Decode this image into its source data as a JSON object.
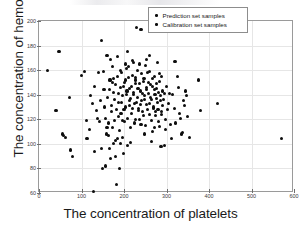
{
  "axes": {
    "xlabel": "The concentration of platelets",
    "ylabel": "The concentration of hemoglobin",
    "xticks": [
      "0",
      "100",
      "200",
      "300",
      "400",
      "500",
      "600"
    ],
    "yticks": [
      "60",
      "80",
      "100",
      "120",
      "140",
      "160",
      "180",
      "200"
    ]
  },
  "legend": {
    "items": [
      {
        "label": "Prediction set samples",
        "marker": "dot",
        "color": "#0d0d0d"
      },
      {
        "label": "Calibration set samples",
        "marker": "dot",
        "color": "#0d0d0d"
      }
    ]
  },
  "colors": {
    "marker": "#0d0d0d",
    "grid": "#e6e6e6",
    "frame": "#9a9a9a",
    "background": "#ffffff",
    "text": "#1a1a1a"
  },
  "chart_data": {
    "type": "scatter",
    "title": "",
    "xlabel": "The concentration of platelets",
    "ylabel": "The concentration of hemoglobin",
    "xlim": [
      0,
      600
    ],
    "ylim": [
      60,
      200
    ],
    "xticks": [
      0,
      100,
      200,
      300,
      400,
      500,
      600
    ],
    "yticks": [
      60,
      80,
      100,
      120,
      140,
      160,
      180,
      200
    ],
    "grid": true,
    "legend_position": "upper right",
    "series": [
      {
        "name": "Prediction set samples",
        "marker": "dot",
        "color": "#0d0d0d",
        "points": [
          [
            20,
            160
          ],
          [
            40,
            127
          ],
          [
            47,
            175
          ],
          [
            55,
            108
          ],
          [
            57,
            107
          ],
          [
            62,
            105
          ],
          [
            72,
            138
          ],
          [
            75,
            95
          ],
          [
            78,
            90
          ],
          [
            108,
            159
          ],
          [
            112,
            119
          ],
          [
            113,
            104
          ],
          [
            122,
            139
          ],
          [
            128,
            61
          ],
          [
            131,
            94
          ],
          [
            138,
            121
          ],
          [
            146,
            184
          ],
          [
            150,
            80
          ],
          [
            152,
            159
          ],
          [
            155,
            130
          ],
          [
            156,
            82
          ],
          [
            158,
            108
          ],
          [
            160,
            172
          ],
          [
            163,
            117
          ],
          [
            165,
            144
          ],
          [
            168,
            169
          ],
          [
            170,
            126
          ],
          [
            172,
            150
          ],
          [
            174,
            113
          ],
          [
            176,
            100
          ],
          [
            178,
            136
          ],
          [
            180,
            90
          ],
          [
            182,
            67
          ],
          [
            184,
            155
          ],
          [
            186,
            141
          ],
          [
            188,
            122
          ],
          [
            190,
            80
          ],
          [
            192,
            160
          ],
          [
            194,
            134
          ],
          [
            196,
            105
          ],
          [
            198,
            147
          ],
          [
            200,
            128
          ],
          [
            202,
            118
          ],
          [
            204,
            152
          ],
          [
            206,
            140
          ],
          [
            208,
            99
          ],
          [
            210,
            163
          ],
          [
            212,
            131
          ],
          [
            214,
            145
          ],
          [
            216,
            137
          ],
          [
            218,
            125
          ],
          [
            220,
            156
          ],
          [
            222,
            142
          ],
          [
            224,
            133
          ],
          [
            226,
            120
          ],
          [
            228,
            149
          ],
          [
            230,
            195
          ],
          [
            232,
            138
          ],
          [
            234,
            129
          ],
          [
            236,
            165
          ],
          [
            238,
            143
          ],
          [
            240,
            193
          ],
          [
            242,
            135
          ],
          [
            244,
            126
          ],
          [
            246,
            151
          ],
          [
            248,
            139
          ],
          [
            250,
            115
          ],
          [
            252,
            146
          ],
          [
            254,
            132
          ],
          [
            256,
            158
          ],
          [
            258,
            141
          ],
          [
            260,
            124
          ],
          [
            262,
            148
          ],
          [
            264,
            136
          ],
          [
            266,
            110
          ],
          [
            268,
            153
          ],
          [
            270,
            130
          ],
          [
            272,
            144
          ],
          [
            274,
            123
          ],
          [
            276,
            137
          ],
          [
            278,
            166
          ],
          [
            280,
            128
          ],
          [
            282,
            142
          ],
          [
            284,
            114
          ],
          [
            286,
            135
          ],
          [
            288,
            155
          ],
          [
            290,
            131
          ],
          [
            295,
            99
          ],
          [
            298,
            120
          ],
          [
            300,
            147
          ],
          [
            305,
            133
          ],
          [
            310,
            116
          ],
          [
            315,
            140
          ],
          [
            320,
            167
          ],
          [
            325,
            155
          ],
          [
            330,
            125
          ],
          [
            335,
            108
          ],
          [
            340,
            135
          ],
          [
            345,
            143
          ],
          [
            350,
            122
          ],
          [
            355,
            105
          ],
          [
            375,
            152
          ],
          [
            380,
            127
          ],
          [
            420,
            133
          ],
          [
            570,
            104
          ]
        ]
      },
      {
        "name": "Calibration set samples",
        "marker": "dot",
        "color": "#0d0d0d",
        "points": [
          [
            100,
            156
          ],
          [
            118,
            112
          ],
          [
            125,
            133
          ],
          [
            135,
            127
          ],
          [
            142,
            118
          ],
          [
            148,
            96
          ],
          [
            153,
            144
          ],
          [
            157,
            121
          ],
          [
            161,
            138
          ],
          [
            164,
            107
          ],
          [
            167,
            152
          ],
          [
            169,
            88
          ],
          [
            171,
            131
          ],
          [
            173,
            163
          ],
          [
            175,
            142
          ],
          [
            177,
            119
          ],
          [
            179,
            148
          ],
          [
            181,
            103
          ],
          [
            183,
            128
          ],
          [
            185,
            171
          ],
          [
            187,
            134
          ],
          [
            189,
            111
          ],
          [
            191,
            146
          ],
          [
            193,
            125
          ],
          [
            195,
            158
          ],
          [
            197,
            139
          ],
          [
            199,
            92
          ],
          [
            201,
            150
          ],
          [
            203,
            130
          ],
          [
            205,
            161
          ],
          [
            207,
            143
          ],
          [
            209,
            121
          ],
          [
            211,
            154
          ],
          [
            213,
            135
          ],
          [
            215,
            113
          ],
          [
            217,
            147
          ],
          [
            219,
            129
          ],
          [
            221,
            168
          ],
          [
            223,
            140
          ],
          [
            225,
            117
          ],
          [
            227,
            152
          ],
          [
            229,
            134
          ],
          [
            231,
            160
          ],
          [
            233,
            145
          ],
          [
            235,
            127
          ],
          [
            237,
            149
          ],
          [
            239,
            132
          ],
          [
            241,
            157
          ],
          [
            243,
            141
          ],
          [
            245,
            123
          ],
          [
            247,
            153
          ],
          [
            249,
            136
          ],
          [
            251,
            164
          ],
          [
            253,
            144
          ],
          [
            255,
            128
          ],
          [
            257,
            150
          ],
          [
            259,
            133
          ],
          [
            261,
            159
          ],
          [
            263,
            138
          ],
          [
            265,
            119
          ],
          [
            267,
            147
          ],
          [
            269,
            129
          ],
          [
            271,
            155
          ],
          [
            273,
            140
          ],
          [
            275,
            126
          ],
          [
            277,
            145
          ],
          [
            279,
            134
          ],
          [
            281,
            118
          ],
          [
            283,
            151
          ],
          [
            285,
            139
          ],
          [
            287,
            98
          ],
          [
            289,
            124
          ],
          [
            291,
            143
          ],
          [
            293,
            136
          ],
          [
            297,
            112
          ],
          [
            302,
            128
          ],
          [
            308,
            141
          ],
          [
            312,
            104
          ],
          [
            318,
            129
          ],
          [
            322,
            117
          ],
          [
            328,
            146
          ],
          [
            333,
            121
          ],
          [
            338,
            109
          ],
          [
            343,
            131
          ],
          [
            348,
            139
          ],
          [
            130,
            147
          ],
          [
            140,
            158
          ],
          [
            145,
            135
          ],
          [
            166,
            96
          ],
          [
            184,
            104
          ],
          [
            196,
            119
          ],
          [
            208,
            175
          ],
          [
            222,
            166
          ],
          [
            236,
            120
          ],
          [
            248,
            108
          ],
          [
            260,
            172
          ],
          [
            272,
            113
          ],
          [
            284,
            157
          ],
          [
            296,
            141
          ],
          [
            160,
            113
          ],
          [
            176,
            153
          ],
          [
            192,
            100
          ],
          [
            204,
            165
          ],
          [
            216,
            101
          ],
          [
            228,
            154
          ],
          [
            240,
            116
          ],
          [
            252,
            169
          ],
          [
            264,
            102
          ],
          [
            276,
            149
          ],
          [
            288,
            126
          ]
        ]
      }
    ]
  }
}
